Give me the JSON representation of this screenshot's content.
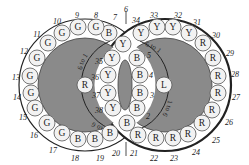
{
  "diagram": {
    "colors": {
      "background": "#ffffff",
      "disc_fill": "#8a8a8a",
      "ring_band": "#ffffff",
      "ball_fill": "#f2f2f2",
      "ball_stroke": "#555555",
      "outline": "#222222",
      "label": "#222222"
    },
    "pivots": [
      {
        "id": "left-pivot",
        "letter": "R",
        "x": 85,
        "y": 85
      },
      {
        "id": "right-pivot",
        "letter": "L",
        "x": 164,
        "y": 85
      }
    ],
    "balls": [
      {
        "n": "1",
        "letter": "B",
        "x": 127,
        "y": 123
      },
      {
        "n": "2",
        "letter": "B",
        "x": 137,
        "y": 108
      },
      {
        "n": "3",
        "letter": "B",
        "x": 140,
        "y": 93
      },
      {
        "n": "4",
        "letter": "B",
        "x": 140,
        "y": 75
      },
      {
        "n": "5",
        "letter": "B",
        "x": 137,
        "y": 58
      },
      {
        "n": "6",
        "letter": "Y",
        "x": 123,
        "y": 44
      },
      {
        "n": "7",
        "letter": "B",
        "x": 109,
        "y": 33
      },
      {
        "n": "8",
        "letter": "G",
        "x": 96,
        "y": 27
      },
      {
        "n": "9",
        "letter": "G",
        "x": 78,
        "y": 27
      },
      {
        "n": "10",
        "letter": "G",
        "x": 62,
        "y": 33
      },
      {
        "n": "11",
        "letter": "G",
        "x": 48,
        "y": 43
      },
      {
        "n": "12",
        "letter": "G",
        "x": 37,
        "y": 58
      },
      {
        "n": "13",
        "letter": "G",
        "x": 30,
        "y": 76
      },
      {
        "n": "14",
        "letter": "G",
        "x": 31,
        "y": 93
      },
      {
        "n": "15",
        "letter": "G",
        "x": 35,
        "y": 108
      },
      {
        "n": "16",
        "letter": "G",
        "x": 47,
        "y": 123
      },
      {
        "n": "17",
        "letter": "G",
        "x": 62,
        "y": 133
      },
      {
        "n": "18",
        "letter": "B",
        "x": 78,
        "y": 139
      },
      {
        "n": "19",
        "letter": "B",
        "x": 95,
        "y": 139
      },
      {
        "n": "20",
        "letter": "B",
        "x": 110,
        "y": 133
      },
      {
        "n": "21",
        "letter": "R",
        "x": 138,
        "y": 135
      },
      {
        "n": "22",
        "letter": "R",
        "x": 156,
        "y": 138
      },
      {
        "n": "23",
        "letter": "R",
        "x": 173,
        "y": 138
      },
      {
        "n": "24",
        "letter": "R",
        "x": 188,
        "y": 134
      },
      {
        "n": "25",
        "letter": "R",
        "x": 202,
        "y": 123
      },
      {
        "n": "26",
        "letter": "R",
        "x": 212,
        "y": 110
      },
      {
        "n": "27",
        "letter": "R",
        "x": 218,
        "y": 93
      },
      {
        "n": "28",
        "letter": "R",
        "x": 218,
        "y": 76
      },
      {
        "n": "29",
        "letter": "R",
        "x": 213,
        "y": 58
      },
      {
        "n": "30",
        "letter": "R",
        "x": 203,
        "y": 43
      },
      {
        "n": "31",
        "letter": "Y",
        "x": 189,
        "y": 33
      },
      {
        "n": "32",
        "letter": "Y",
        "x": 173,
        "y": 27
      },
      {
        "n": "33",
        "letter": "Y",
        "x": 157,
        "y": 27
      },
      {
        "n": "34",
        "letter": "Y",
        "x": 141,
        "y": 33
      },
      {
        "n": "35",
        "letter": "Y",
        "x": 112,
        "y": 58
      },
      {
        "n": "36",
        "letter": "Y",
        "x": 108,
        "y": 75
      },
      {
        "n": "37",
        "letter": "Y",
        "x": 108,
        "y": 93
      },
      {
        "n": "38",
        "letter": "Y",
        "x": 113,
        "y": 108
      }
    ],
    "outer_labels": [
      {
        "text": "6",
        "x": 126,
        "y": 9
      },
      {
        "text": "7",
        "x": 115,
        "y": 17
      },
      {
        "text": "8",
        "x": 96,
        "y": 15
      },
      {
        "text": "9",
        "x": 77,
        "y": 15
      },
      {
        "text": "10",
        "x": 57,
        "y": 21
      },
      {
        "text": "11",
        "x": 37,
        "y": 34
      },
      {
        "text": "12",
        "x": 24,
        "y": 51
      },
      {
        "text": "13",
        "x": 16,
        "y": 77
      },
      {
        "text": "14",
        "x": 17,
        "y": 97
      },
      {
        "text": "15",
        "x": 23,
        "y": 117
      },
      {
        "text": "16",
        "x": 34,
        "y": 135
      },
      {
        "text": "17",
        "x": 53,
        "y": 150
      },
      {
        "text": "18",
        "x": 75,
        "y": 158
      },
      {
        "text": "19",
        "x": 100,
        "y": 158
      },
      {
        "text": "20",
        "x": 116,
        "y": 153
      },
      {
        "text": "21",
        "x": 134,
        "y": 153
      },
      {
        "text": "22",
        "x": 154,
        "y": 158
      },
      {
        "text": "23",
        "x": 174,
        "y": 158
      },
      {
        "text": "24",
        "x": 196,
        "y": 152
      },
      {
        "text": "25",
        "x": 216,
        "y": 140
      },
      {
        "text": "26",
        "x": 229,
        "y": 122
      },
      {
        "text": "27",
        "x": 236,
        "y": 97
      },
      {
        "text": "28",
        "x": 235,
        "y": 74
      },
      {
        "text": "29",
        "x": 230,
        "y": 53
      },
      {
        "text": "30",
        "x": 216,
        "y": 35
      },
      {
        "text": "31",
        "x": 197,
        "y": 22
      },
      {
        "text": "32",
        "x": 178,
        "y": 15
      },
      {
        "text": "33",
        "x": 154,
        "y": 15
      },
      {
        "text": "34",
        "x": 136,
        "y": 20
      }
    ],
    "inner_labels": [
      {
        "text": "35",
        "x": 99,
        "y": 61
      },
      {
        "text": "36",
        "x": 95,
        "y": 77
      },
      {
        "text": "37",
        "x": 96,
        "y": 95
      },
      {
        "text": "38",
        "x": 99,
        "y": 110
      },
      {
        "text": "5",
        "x": 149,
        "y": 55
      },
      {
        "text": "4",
        "x": 151,
        "y": 75
      },
      {
        "text": "3",
        "x": 152,
        "y": 95
      },
      {
        "text": "2",
        "x": 148,
        "y": 116
      }
    ],
    "arc_captions": [
      {
        "id": "left-upper",
        "text": "6 to 1"
      },
      {
        "id": "left-lower",
        "text": "1 to 6"
      },
      {
        "id": "right-upper",
        "text": "6 to 1"
      },
      {
        "id": "right-lower",
        "text": "1 to 6"
      }
    ]
  }
}
